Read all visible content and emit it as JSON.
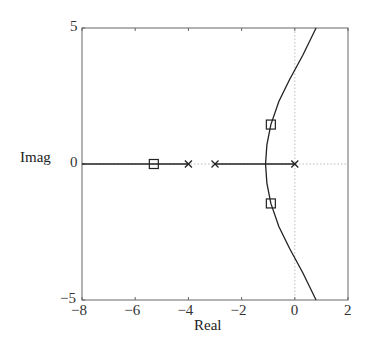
{
  "chart_data": {
    "type": "line",
    "subtype": "root-locus",
    "title": "",
    "xlabel": "Real",
    "ylabel": "Imag",
    "xlim": [
      -8,
      2
    ],
    "ylim": [
      -5,
      5
    ],
    "xticks": [
      -8,
      -6,
      -4,
      -2,
      0,
      2
    ],
    "xtick_labels": [
      "−8",
      "−6",
      "−4",
      "−2",
      "0",
      "2"
    ],
    "yticks": [
      -5,
      0,
      5
    ],
    "ytick_labels": [
      "−5",
      "0",
      "5"
    ],
    "grid": false,
    "reference_lines": {
      "x_zero": "dotted",
      "y_zero": "dotted"
    },
    "poles": [
      {
        "re": 0,
        "im": 0,
        "marker": "x"
      },
      {
        "re": -3,
        "im": 0,
        "marker": "x"
      },
      {
        "re": -4,
        "im": 0,
        "marker": "x"
      }
    ],
    "highlighted_points": [
      {
        "re": -5.3,
        "im": 0,
        "marker": "square"
      },
      {
        "re": -0.9,
        "im": 1.45,
        "marker": "square"
      },
      {
        "re": -0.9,
        "im": -1.45,
        "marker": "square"
      }
    ],
    "series": [
      {
        "name": "real-axis branch (left)",
        "x": [
          -8,
          -4
        ],
        "y": [
          0,
          0
        ]
      },
      {
        "name": "real-axis branch (between -3 and 0)",
        "x": [
          -3,
          0
        ],
        "y": [
          0,
          0
        ]
      },
      {
        "name": "upper branch",
        "x": [
          -1.1,
          -1.05,
          -0.9,
          -0.6,
          -0.2,
          0.3,
          0.8
        ],
        "y": [
          0,
          0.7,
          1.45,
          2.3,
          3.1,
          4.0,
          5.0
        ]
      },
      {
        "name": "lower branch",
        "x": [
          -1.1,
          -1.05,
          -0.9,
          -0.6,
          -0.2,
          0.3,
          0.8
        ],
        "y": [
          0,
          -0.7,
          -1.45,
          -2.3,
          -3.1,
          -4.0,
          -5.0
        ]
      }
    ],
    "breakaway_point": {
      "re": -1.1,
      "im": 0
    }
  },
  "plot_area": {
    "left": 82,
    "top": 28,
    "right": 348,
    "bottom": 300
  }
}
